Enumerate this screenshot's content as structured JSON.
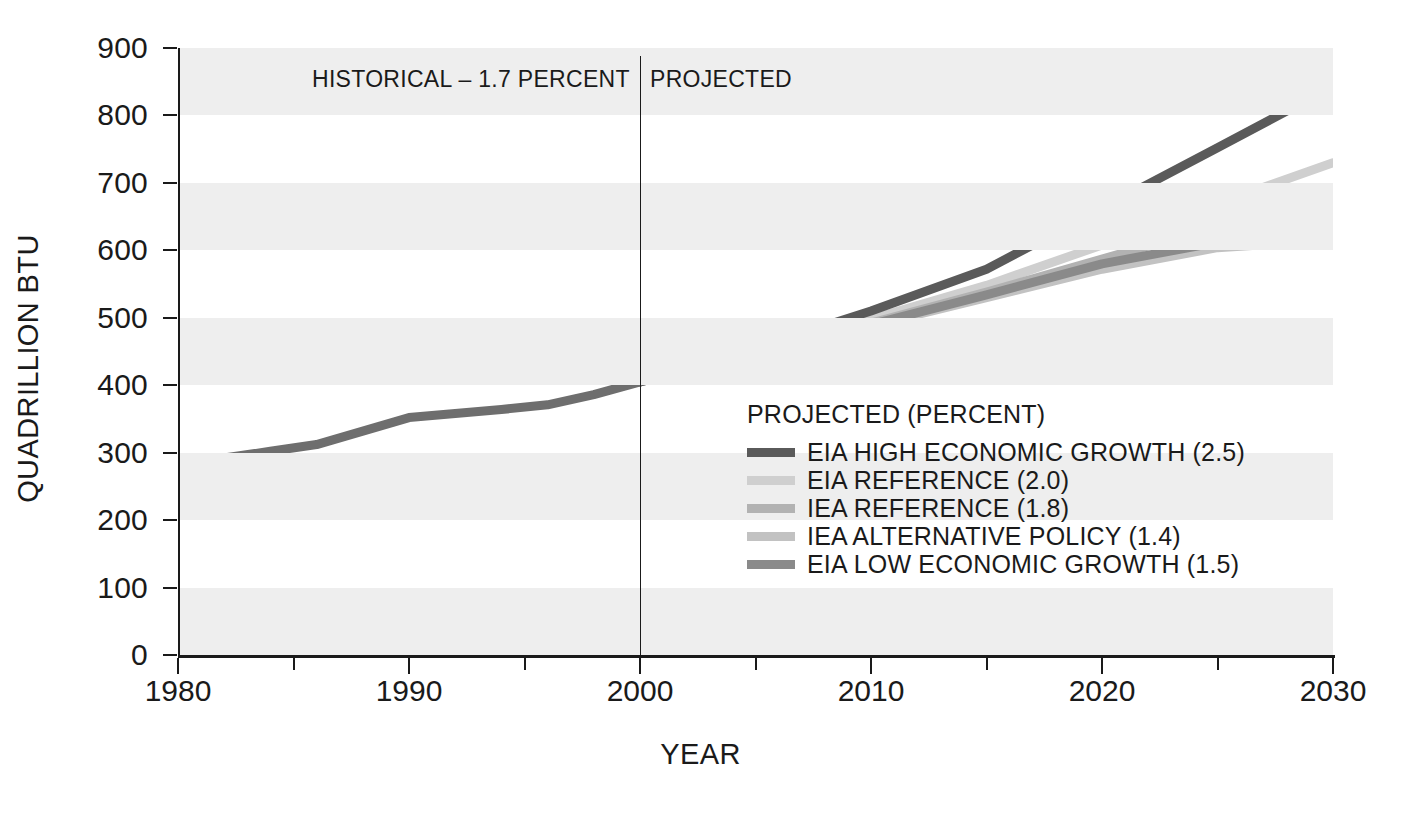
{
  "chart_data": {
    "type": "line",
    "title": "",
    "xlabel": "YEAR",
    "ylabel": "QUADRILLION BTU",
    "xlim": [
      1980,
      2030
    ],
    "ylim": [
      0,
      900
    ],
    "yticks": [
      0,
      100,
      200,
      300,
      400,
      500,
      600,
      700,
      800,
      900
    ],
    "xticks": [
      1980,
      1990,
      2000,
      2010,
      2020,
      2030
    ],
    "xminorticks": [
      1985,
      1995,
      2005,
      2015,
      2025
    ],
    "grid": "alternating-horizontal-bands",
    "banded_intervals": [
      [
        0,
        100
      ],
      [
        200,
        300
      ],
      [
        400,
        500
      ],
      [
        600,
        700
      ],
      [
        800,
        900
      ]
    ],
    "legend_position": "inside-center-right",
    "divider_year": 2000,
    "annotations": [
      {
        "text": "HISTORICAL – 1.7 PERCENT",
        "x": 1990,
        "y": 860
      },
      {
        "text": "PROJECTED",
        "x": 2004,
        "y": 860
      }
    ],
    "x": [
      1980,
      1985,
      1990,
      1995,
      2000,
      2005,
      2010,
      2015,
      2020,
      2025,
      2030
    ],
    "series": [
      {
        "name": "EIA HIGH ECONOMIC GROWTH (2.5)",
        "percent": 2.5,
        "color": "#5a5a5a",
        "values": [
          285,
          310,
          352,
          371,
          405,
          455,
          510,
          572,
          662,
          752,
          843
        ]
      },
      {
        "name": "EIA REFERENCE (2.0)",
        "percent": 2.0,
        "color": "#cfcfcf",
        "values": [
          285,
          310,
          352,
          371,
          405,
          450,
          498,
          548,
          608,
          669,
          730
        ]
      },
      {
        "name": "IEA REFERENCE (1.8)",
        "percent": 1.8,
        "color": "#b2b2b2",
        "values": [
          285,
          310,
          352,
          371,
          405,
          448,
          492,
          538,
          587,
          636,
          685
        ]
      },
      {
        "name": "IEA ALTERNATIVE POLICY (1.4)",
        "percent": 1.4,
        "color": "#c2c2c2",
        "values": [
          285,
          310,
          352,
          371,
          405,
          446,
          488,
          530,
          572,
          604,
          615
        ]
      },
      {
        "name": "EIA LOW ECONOMIC GROWTH (1.5)",
        "percent": 1.5,
        "color": "#8a8a8a",
        "values": [
          285,
          310,
          352,
          371,
          405,
          447,
          490,
          534,
          580,
          612,
          638
        ]
      }
    ],
    "historical_series": {
      "name": "HISTORICAL",
      "percent": 1.7,
      "color": "#6e6e6e",
      "x": [
        1980,
        1982,
        1984,
        1986,
        1988,
        1990,
        1992,
        1994,
        1996,
        1998,
        2000
      ],
      "values": [
        285,
        292,
        302,
        312,
        332,
        352,
        358,
        364,
        371,
        386,
        405
      ]
    }
  },
  "legend": {
    "title": "PROJECTED (PERCENT)",
    "items": [
      {
        "label": "EIA HIGH ECONOMIC GROWTH (2.5)",
        "color": "#5a5a5a"
      },
      {
        "label": "EIA REFERENCE (2.0)",
        "color": "#cfcfcf"
      },
      {
        "label": "IEA REFERENCE (1.8)",
        "color": "#b2b2b2"
      },
      {
        "label": "IEA ALTERNATIVE POLICY (1.4)",
        "color": "#c2c2c2"
      },
      {
        "label": "EIA LOW ECONOMIC GROWTH (1.5)",
        "color": "#8a8a8a"
      }
    ]
  },
  "annotations": {
    "historical": "HISTORICAL – 1.7 PERCENT",
    "projected": "PROJECTED"
  },
  "axes": {
    "ylabel": "QUADRILLION BTU",
    "xlabel": "YEAR",
    "yticks": [
      "900",
      "800",
      "700",
      "600",
      "500",
      "400",
      "300",
      "200",
      "100",
      "0"
    ],
    "xticks": [
      "1980",
      "1990",
      "2000",
      "2010",
      "2020",
      "2030"
    ]
  },
  "colors": {
    "band": "#eeeeee",
    "axis": "#1a1a1a",
    "text": "#1a1a1a"
  }
}
